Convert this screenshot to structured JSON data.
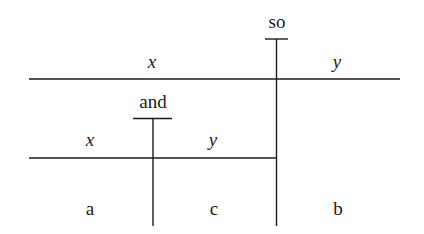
{
  "diagram": {
    "type": "nested-split-diagram",
    "outer_connective": "so",
    "outer_left_label": "x",
    "outer_right_label": "y",
    "inner_connective": "and",
    "inner_left_label": "x",
    "inner_right_label": "y",
    "regions": [
      "a",
      "c",
      "b"
    ]
  }
}
